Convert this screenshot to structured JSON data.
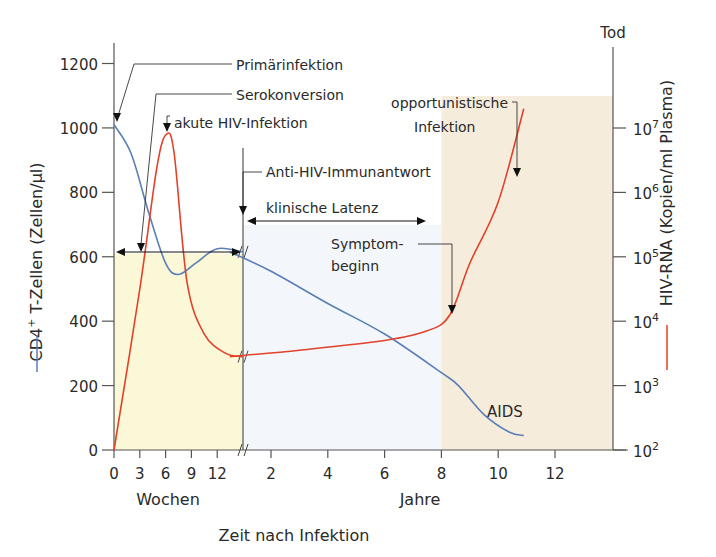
{
  "chart_data": {
    "type": "line",
    "title": "",
    "xlabel": "Zeit nach Infektion",
    "x_segments": [
      {
        "name": "weeks",
        "label": "Wochen",
        "ticks": [
          0,
          3,
          6,
          9,
          12
        ],
        "tick_labels": [
          "0",
          "3",
          "6",
          "9",
          "12"
        ],
        "range": [
          0,
          15
        ]
      },
      {
        "name": "years",
        "label": "Jahre",
        "ticks": [
          2,
          4,
          6,
          8,
          10,
          12
        ],
        "tick_labels": [
          "2",
          "4",
          "6",
          "8",
          "10",
          "12"
        ],
        "range": [
          0.55,
          13.2
        ]
      }
    ],
    "y_left": {
      "label_main": "CD4",
      "label_sup": "+",
      "label_rest": " T-Zellen (Zellen/µl)",
      "legend_color": "#5a7fb5",
      "ticks": [
        0,
        200,
        400,
        600,
        800,
        1000,
        1200
      ],
      "tick_labels": [
        "0",
        "200",
        "400",
        "600",
        "800",
        "1000",
        "1200"
      ],
      "range": [
        0,
        1200
      ]
    },
    "y_right": {
      "label": "HIV-RNA (Kopien/ml Plasma)",
      "scale": "log",
      "legend_color": "#e2412a",
      "ticks": [
        2,
        3,
        4,
        5,
        6,
        7
      ],
      "tick_base": "10",
      "tick_exponents": [
        "2",
        "3",
        "4",
        "5",
        "6",
        "7"
      ],
      "range_log10": [
        2,
        7
      ],
      "top_label": "Tod"
    },
    "series": [
      {
        "name": "CD4+ T-Zellen",
        "color": "#5a7fb5",
        "axis": "left",
        "points": [
          {
            "seg": "weeks",
            "x": 0,
            "y": 1010
          },
          {
            "seg": "weeks",
            "x": 2,
            "y": 920
          },
          {
            "seg": "weeks",
            "x": 4,
            "y": 740
          },
          {
            "seg": "weeks",
            "x": 6,
            "y": 580
          },
          {
            "seg": "weeks",
            "x": 7.5,
            "y": 545
          },
          {
            "seg": "weeks",
            "x": 9.5,
            "y": 580
          },
          {
            "seg": "weeks",
            "x": 12,
            "y": 625
          },
          {
            "seg": "weeks",
            "x": 15,
            "y": 615
          },
          {
            "seg": "years",
            "x": 0.55,
            "y": 615
          },
          {
            "seg": "years",
            "x": 2,
            "y": 555
          },
          {
            "seg": "years",
            "x": 4,
            "y": 455
          },
          {
            "seg": "years",
            "x": 6,
            "y": 360
          },
          {
            "seg": "years",
            "x": 8,
            "y": 240
          },
          {
            "seg": "years",
            "x": 8.6,
            "y": 200
          },
          {
            "seg": "years",
            "x": 9.5,
            "y": 110
          },
          {
            "seg": "years",
            "x": 10.4,
            "y": 55
          },
          {
            "seg": "years",
            "x": 10.9,
            "y": 45
          }
        ]
      },
      {
        "name": "HIV-RNA",
        "color": "#e2412a",
        "axis": "right",
        "points": [
          {
            "seg": "weeks",
            "x": 0,
            "y": 2.0
          },
          {
            "seg": "weeks",
            "x": 3,
            "y": 4.5
          },
          {
            "seg": "weeks",
            "x": 5,
            "y": 6.4
          },
          {
            "seg": "weeks",
            "x": 6.1,
            "y": 6.9
          },
          {
            "seg": "weeks",
            "x": 7,
            "y": 6.6
          },
          {
            "seg": "weeks",
            "x": 8.5,
            "y": 4.6
          },
          {
            "seg": "weeks",
            "x": 10.5,
            "y": 3.8
          },
          {
            "seg": "weeks",
            "x": 13,
            "y": 3.5
          },
          {
            "seg": "weeks",
            "x": 15,
            "y": 3.45
          },
          {
            "seg": "years",
            "x": 0.55,
            "y": 3.45
          },
          {
            "seg": "years",
            "x": 3,
            "y": 3.55
          },
          {
            "seg": "years",
            "x": 6,
            "y": 3.7
          },
          {
            "seg": "years",
            "x": 7.5,
            "y": 3.85
          },
          {
            "seg": "years",
            "x": 8.3,
            "y": 4.1
          },
          {
            "seg": "years",
            "x": 9,
            "y": 4.9
          },
          {
            "seg": "years",
            "x": 10,
            "y": 5.85
          },
          {
            "seg": "years",
            "x": 10.9,
            "y": 7.3
          }
        ]
      }
    ],
    "shaded_regions": [
      {
        "name": "acute-phase",
        "seg": "weeks",
        "x0": 0,
        "x1": 15,
        "y_top_left": 610,
        "color": "#fbf8d8"
      },
      {
        "name": "latency",
        "seg": "years",
        "x0": 0.55,
        "x1": 8,
        "color": "#f3f7fc"
      },
      {
        "name": "aids",
        "seg": "years",
        "x0": 8,
        "x1": 13.2,
        "y_top_right_log": 7.3,
        "color": "#f6ecdc",
        "label": "AIDS"
      }
    ],
    "annotations": [
      {
        "id": "primaerinfektion",
        "text": "Primärinfektion"
      },
      {
        "id": "serokonversion",
        "text": "Serokonversion"
      },
      {
        "id": "akute",
        "text": "akute HIV-Infektion"
      },
      {
        "id": "antihiv",
        "text": "Anti-HIV-Immunantwort"
      },
      {
        "id": "latenz",
        "text": "klinische Latenz"
      },
      {
        "id": "symptom1",
        "text": "Symptom-"
      },
      {
        "id": "symptom2",
        "text": "beginn"
      },
      {
        "id": "opport1",
        "text": "opportunistische"
      },
      {
        "id": "opport2",
        "text": "Infektion"
      },
      {
        "id": "aids",
        "text": "AIDS"
      }
    ],
    "grid": false,
    "legend": "axis-labels"
  }
}
